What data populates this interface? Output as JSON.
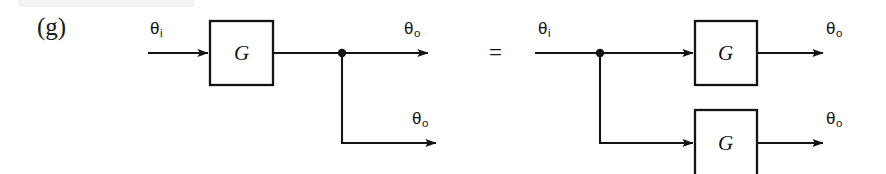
{
  "figure": {
    "part_label": "(g)",
    "equals_sign": "=",
    "description_type": "block-diagram",
    "background_color": "#ffffff",
    "line_color": "#141414",
    "text_color": "#141414"
  },
  "symbols": {
    "theta": "θ",
    "input_subscript": "i",
    "output_subscript": "o",
    "block_label": "G"
  },
  "left_side": {
    "name": "single-block-with-takeoff-point",
    "input_label": {
      "base": "θ",
      "sub": "i"
    },
    "blocks": [
      {
        "id": "block-g-left",
        "label": "G",
        "x": 210,
        "y": 21,
        "width": 63,
        "height": 64
      }
    ],
    "junction": {
      "id": "takeoff-point-left",
      "x": 342,
      "y": 53
    },
    "outputs": [
      {
        "id": "output-left-top",
        "base": "θ",
        "sub": "o",
        "arrow_y": 53,
        "arrow_tip_x": 430
      },
      {
        "id": "output-left-bottom",
        "base": "θ",
        "sub": "o",
        "arrow_y": 143,
        "arrow_tip_x": 438
      }
    ]
  },
  "right_side": {
    "name": "two-parallel-blocks-from-takeoff-point",
    "input_label": {
      "base": "θ",
      "sub": "i"
    },
    "junction": {
      "id": "takeoff-point-right",
      "x": 600,
      "y": 53
    },
    "blocks": [
      {
        "id": "block-g-right-top",
        "label": "G",
        "x": 695,
        "y": 21,
        "width": 62,
        "height": 64
      },
      {
        "id": "block-g-right-bottom",
        "label": "G",
        "x": 695,
        "y": 110,
        "width": 62,
        "height": 64
      }
    ],
    "outputs": [
      {
        "id": "output-right-top",
        "base": "θ",
        "sub": "o",
        "arrow_y": 53,
        "arrow_tip_x": 825
      },
      {
        "id": "output-right-bottom",
        "base": "θ",
        "sub": "o",
        "arrow_y": 143,
        "arrow_tip_x": 825
      }
    ]
  }
}
